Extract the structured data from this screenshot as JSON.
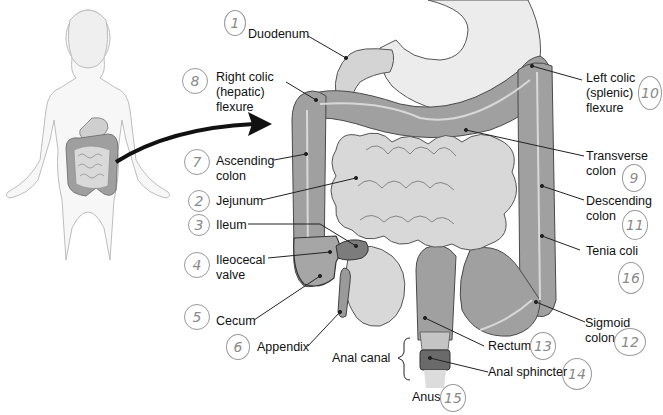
{
  "diagram": {
    "colors": {
      "colon": "#9c9c9c",
      "colon_band": "#c8c8c8",
      "small_intestine": "#d6d6d6",
      "stomach": "#e4e4e4",
      "outline": "#4a4a4a",
      "leader_line": "#222222",
      "handwriting": "#8a8a8a",
      "body_outline": "#bdbdbd"
    },
    "labels": [
      {
        "id": "duodenum",
        "text": "Duodenum",
        "number": "1"
      },
      {
        "id": "right-colic-flexure",
        "text": "Right colic\n(hepatic)\nflexure",
        "number": "8"
      },
      {
        "id": "ascending-colon",
        "text": "Ascending\ncolon",
        "number": "7"
      },
      {
        "id": "jejunum",
        "text": "Jejunum",
        "number": "2"
      },
      {
        "id": "ileum",
        "text": "Ileum",
        "number": "3"
      },
      {
        "id": "ileocecal-valve",
        "text": "Ileocecal\nvalve",
        "number": "4"
      },
      {
        "id": "cecum",
        "text": "Cecum",
        "number": "5"
      },
      {
        "id": "appendix",
        "text": "Appendix",
        "number": "6"
      },
      {
        "id": "anal-canal",
        "text": "Anal canal",
        "number": ""
      },
      {
        "id": "anus",
        "text": "Anus",
        "number": "15"
      },
      {
        "id": "rectum",
        "text": "Rectum",
        "number": "13"
      },
      {
        "id": "anal-sphincter",
        "text": "Anal sphincter",
        "number": "14"
      },
      {
        "id": "sigmoid-colon",
        "text": "Sigmoid\ncolon",
        "number": "12"
      },
      {
        "id": "tenia-coli",
        "text": "Tenia coli",
        "number": "16"
      },
      {
        "id": "descending-colon",
        "text": "Descending\ncolon",
        "number": "11"
      },
      {
        "id": "transverse-colon",
        "text": "Transverse\ncolon",
        "number": "9"
      },
      {
        "id": "left-colic-flexure",
        "text": "Left colic\n(splenic)\nflexure",
        "number": "10"
      }
    ]
  }
}
